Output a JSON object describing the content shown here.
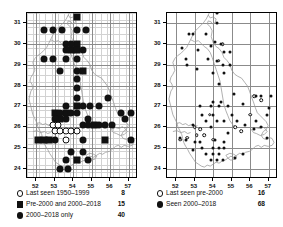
{
  "figure": {
    "type": "distribution-map-pair",
    "panels": [
      {
        "id": "left",
        "axis": {
          "x_ticks": [
            "52",
            "53",
            "54",
            "55",
            "56",
            "57"
          ],
          "y_ticks": [
            "31",
            "30",
            "29",
            "28",
            "27",
            "26",
            "25",
            "24"
          ],
          "xlim": [
            51.5,
            57.5
          ],
          "ylim": [
            23.5,
            31.5
          ],
          "grid": true
        },
        "legend": [
          {
            "symbol": "open-circle",
            "label": "Last seen 1950–1999",
            "count": "8"
          },
          {
            "symbol": "filled-square",
            "label": "Pre-2000 and 2000–2018",
            "count": "15"
          },
          {
            "symbol": "filled-circle",
            "label": "2000–2018 only",
            "count": "40"
          }
        ]
      },
      {
        "id": "right",
        "axis": {
          "x_ticks": [
            "52",
            "53",
            "54",
            "55",
            "56",
            "57"
          ],
          "y_ticks": [
            "31",
            "30",
            "29",
            "28",
            "27",
            "26",
            "25",
            "24"
          ],
          "xlim": [
            51.5,
            57.5
          ],
          "ylim": [
            23.5,
            31.5
          ],
          "grid": true
        },
        "legend": [
          {
            "symbol": "open-circle",
            "label": "Last seen pre-2000",
            "count": "16"
          },
          {
            "symbol": "filled-circle",
            "label": "Seen 2000–2018",
            "count": "68"
          }
        ]
      }
    ]
  },
  "chart_data": {
    "type": "scatter",
    "title": "",
    "xlabel": "",
    "ylabel": "",
    "xlim": [
      51.5,
      57.5
    ],
    "ylim": [
      23.5,
      31.5
    ],
    "grid": true,
    "legend_position": "below-axes",
    "series": [
      {
        "panel": "left",
        "name": "Last seen 1950-1999",
        "symbol": "open-circle",
        "count": 8,
        "points": [
          [
            53.0,
            25.8
          ],
          [
            53.3,
            25.8
          ],
          [
            53.6,
            25.8
          ],
          [
            53.6,
            25.4
          ],
          [
            52.9,
            26.1
          ],
          [
            53.2,
            26.1
          ],
          [
            53.9,
            25.8
          ],
          [
            54.2,
            25.8
          ]
        ]
      },
      {
        "panel": "left",
        "name": "Pre-2000 and 2000-2018",
        "symbol": "filled-square",
        "count": 15,
        "points": [
          [
            54.2,
            31.3
          ],
          [
            54.2,
            30.0
          ],
          [
            53.9,
            29.7
          ],
          [
            54.2,
            29.7
          ],
          [
            54.5,
            28.7
          ],
          [
            54.2,
            27.0
          ],
          [
            53.0,
            26.7
          ],
          [
            53.6,
            26.7
          ],
          [
            53.3,
            26.4
          ],
          [
            52.1,
            25.4
          ],
          [
            52.4,
            25.4
          ],
          [
            52.7,
            25.4
          ],
          [
            55.7,
            25.4
          ],
          [
            54.2,
            24.4
          ],
          [
            55.1,
            26.1
          ]
        ]
      },
      {
        "panel": "left",
        "name": "2000-2018 only",
        "symbol": "filled-circle",
        "count": 40,
        "points": [
          [
            52.4,
            30.7
          ],
          [
            52.9,
            30.7
          ],
          [
            53.4,
            30.7
          ],
          [
            54.2,
            30.7
          ],
          [
            54.7,
            30.7
          ],
          [
            53.6,
            30.0
          ],
          [
            53.9,
            30.0
          ],
          [
            53.6,
            29.7
          ],
          [
            54.5,
            29.7
          ],
          [
            52.4,
            29.3
          ],
          [
            52.9,
            29.3
          ],
          [
            53.6,
            29.3
          ],
          [
            54.2,
            29.3
          ],
          [
            53.3,
            28.7
          ],
          [
            54.2,
            28.7
          ],
          [
            54.2,
            28.3
          ],
          [
            54.2,
            27.9
          ],
          [
            54.2,
            27.4
          ],
          [
            55.9,
            27.4
          ],
          [
            53.6,
            27.0
          ],
          [
            54.5,
            27.0
          ],
          [
            54.9,
            27.0
          ],
          [
            55.4,
            27.0
          ],
          [
            53.3,
            26.7
          ],
          [
            53.9,
            26.7
          ],
          [
            54.2,
            26.7
          ],
          [
            56.6,
            26.7
          ],
          [
            57.1,
            26.7
          ],
          [
            53.0,
            26.4
          ],
          [
            53.6,
            26.4
          ],
          [
            54.8,
            26.4
          ],
          [
            56.8,
            26.4
          ],
          [
            54.5,
            26.1
          ],
          [
            54.8,
            26.1
          ],
          [
            55.4,
            26.1
          ],
          [
            55.7,
            26.1
          ],
          [
            56.1,
            26.1
          ],
          [
            53.0,
            25.4
          ],
          [
            54.5,
            25.4
          ],
          [
            57.1,
            25.4
          ],
          [
            53.9,
            24.8
          ],
          [
            54.5,
            24.8
          ],
          [
            53.6,
            24.4
          ],
          [
            54.8,
            24.4
          ],
          [
            53.3,
            24.0
          ],
          [
            53.7,
            24.0
          ]
        ]
      },
      {
        "panel": "right",
        "name": "Last seen pre-2000",
        "symbol": "open-circle",
        "count": 16,
        "points": [
          [
            54.3,
            31.6
          ],
          [
            54.5,
            30.0
          ],
          [
            54.3,
            29.2
          ],
          [
            56.2,
            27.5
          ],
          [
            56.6,
            27.3
          ],
          [
            53.8,
            26.6
          ],
          [
            53.0,
            26.0
          ],
          [
            53.3,
            25.9
          ],
          [
            52.6,
            25.5
          ],
          [
            52.2,
            25.4
          ],
          [
            53.5,
            25.6
          ],
          [
            55.2,
            26.0
          ],
          [
            55.5,
            25.8
          ],
          [
            54.0,
            25.4
          ],
          [
            56.0,
            26.6
          ],
          [
            53.1,
            25.6
          ]
        ]
      },
      {
        "panel": "right",
        "name": "Seen 2000-2018",
        "symbol": "filled-circle",
        "count": 68,
        "points": [
          [
            54.2,
            31.5
          ],
          [
            54.2,
            31.0
          ],
          [
            52.7,
            30.5
          ],
          [
            52.9,
            30.5
          ],
          [
            53.6,
            30.5
          ],
          [
            54.1,
            30.1
          ],
          [
            54.4,
            30.0
          ],
          [
            53.9,
            29.9
          ],
          [
            52.3,
            29.8
          ],
          [
            53.2,
            29.7
          ],
          [
            54.6,
            29.6
          ],
          [
            54.9,
            29.6
          ],
          [
            52.5,
            29.3
          ],
          [
            53.7,
            29.3
          ],
          [
            54.2,
            29.2
          ],
          [
            52.6,
            29.0
          ],
          [
            54.5,
            29.0
          ],
          [
            54.9,
            29.0
          ],
          [
            54.0,
            28.6
          ],
          [
            54.6,
            28.6
          ],
          [
            54.3,
            28.1
          ],
          [
            55.1,
            27.6
          ],
          [
            56.3,
            27.5
          ],
          [
            56.6,
            27.5
          ],
          [
            57.1,
            27.5
          ],
          [
            54.0,
            27.2
          ],
          [
            54.4,
            27.2
          ],
          [
            55.6,
            27.1
          ],
          [
            53.3,
            27.0
          ],
          [
            53.9,
            27.0
          ],
          [
            54.3,
            27.0
          ],
          [
            54.8,
            27.0
          ],
          [
            53.4,
            26.6
          ],
          [
            54.0,
            26.6
          ],
          [
            55.0,
            26.6
          ],
          [
            56.9,
            26.6
          ],
          [
            53.6,
            26.3
          ],
          [
            54.2,
            26.3
          ],
          [
            54.6,
            26.3
          ],
          [
            55.3,
            26.3
          ],
          [
            56.3,
            26.3
          ],
          [
            52.9,
            26.1
          ],
          [
            53.9,
            26.0
          ],
          [
            55.7,
            26.1
          ],
          [
            56.6,
            26.0
          ],
          [
            52.2,
            25.5
          ],
          [
            52.5,
            25.4
          ],
          [
            53.0,
            25.3
          ],
          [
            53.3,
            25.3
          ],
          [
            54.1,
            25.4
          ],
          [
            54.6,
            25.3
          ],
          [
            56.9,
            25.5
          ],
          [
            53.4,
            25.0
          ],
          [
            54.0,
            25.0
          ],
          [
            54.3,
            25.0
          ],
          [
            54.6,
            25.0
          ],
          [
            53.6,
            24.7
          ],
          [
            54.0,
            24.7
          ],
          [
            54.3,
            24.7
          ],
          [
            55.6,
            24.7
          ],
          [
            53.9,
            24.4
          ],
          [
            54.2,
            24.4
          ],
          [
            54.5,
            24.4
          ],
          [
            52.9,
            24.9
          ],
          [
            55.2,
            24.5
          ],
          [
            56.2,
            25.9
          ],
          [
            57.0,
            26.9
          ],
          [
            53.1,
            28.8
          ],
          [
            54.8,
            25.7
          ]
        ]
      }
    ]
  }
}
